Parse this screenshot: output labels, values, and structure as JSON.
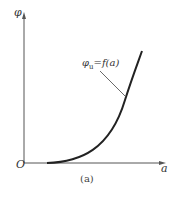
{
  "figure": {
    "y_axis_label": "φ",
    "x_axis_label": "a",
    "origin_label": "O",
    "curve_label_main": "φ",
    "curve_label_sub": "u",
    "curve_label_rest": "=f(a)",
    "caption": "(a)"
  },
  "colors": {
    "axis": "#555555",
    "curve": "#222222",
    "text": "#333333"
  }
}
